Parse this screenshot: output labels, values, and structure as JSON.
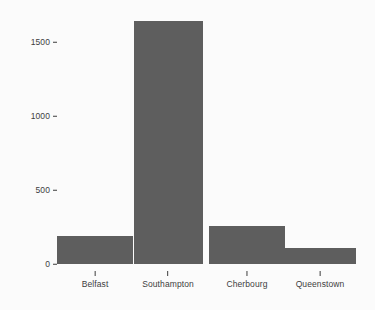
{
  "chart_data": {
    "type": "bar",
    "title": "",
    "subtitle": "",
    "xlabel": "",
    "ylabel": "",
    "categories": [
      "Belfast",
      "Southampton",
      "Cherbourg",
      "Queenstown"
    ],
    "values": [
      190,
      1640,
      255,
      110
    ],
    "series": [
      {
        "name": "count",
        "values": [
          190,
          1640,
          255,
          110
        ]
      }
    ],
    "ylim": [
      0,
      1700
    ],
    "yticks": [
      0,
      500,
      1000,
      1500
    ],
    "ytick_labels": [
      "0",
      "500",
      "1000",
      "1500"
    ],
    "xtick_labels": [
      "Belfast",
      "Southampton",
      "Cherbourg",
      "Queenstown"
    ],
    "grid": false,
    "legend": null,
    "legend_position": "none",
    "annotations": [],
    "bar_color": "#5e5e5e",
    "background_color": "#fbfbfb",
    "axis_text_color": "#3d3d3d"
  },
  "axes": {
    "y_ticks": [
      {
        "label": "1500",
        "value": 1500
      },
      {
        "label": "1000",
        "value": 1000
      },
      {
        "label": "500",
        "value": 500
      },
      {
        "label": "0",
        "value": 0
      }
    ],
    "x_ticks": [
      {
        "label": "Belfast"
      },
      {
        "label": "Southampton"
      },
      {
        "label": "Cherbourg"
      },
      {
        "label": "Queenstown"
      }
    ]
  },
  "bars": [
    {
      "label": "Belfast",
      "value": 190
    },
    {
      "label": "Southampton",
      "value": 1640
    },
    {
      "label": "Cherbourg",
      "value": 255
    },
    {
      "label": "Queenstown",
      "value": 110
    }
  ]
}
